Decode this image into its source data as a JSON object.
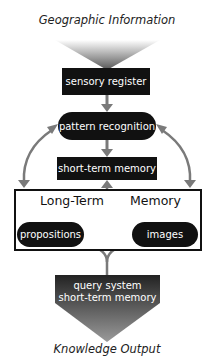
{
  "diagram": {
    "title_top": "Geographic Information",
    "title_bottom": "Knowledge Output",
    "nodes": {
      "sensory_register": "sensory register",
      "pattern_recognition": "pattern recognition",
      "short_term_memory": "short-term memory",
      "long_term_memory_label_left": "Long-Term",
      "long_term_memory_label_right": "Memory",
      "propositions": "propositions",
      "images": "images",
      "query_system_line1": "query system",
      "query_system_line2": "short-term memory"
    },
    "colors": {
      "node_fill": "#111111",
      "node_text": "#ffffff",
      "arrow": "#7a7a7a"
    }
  }
}
